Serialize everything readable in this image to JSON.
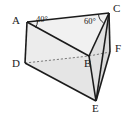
{
  "figure": {
    "kind": "triangular-prism-diagram",
    "background_color": "#ffffff",
    "stroke_color": "#1b1b1b",
    "dashed_stroke_color": "#6f6f6f",
    "face_fill_top": "#f2f2f2",
    "face_fill_front": "#e6e6e6",
    "face_fill_right": "#dedede",
    "face_fill_inner": "#ebebeb",
    "vertices": [
      {
        "name": "A",
        "label": "A",
        "x": 27,
        "y": 22,
        "label_x": 12,
        "label_y": 15
      },
      {
        "name": "B",
        "label": "B",
        "x": 89,
        "y": 56,
        "label_x": 84,
        "label_y": 58
      },
      {
        "name": "C",
        "label": "C",
        "x": 109,
        "y": 13,
        "label_x": 113,
        "label_y": 4
      },
      {
        "name": "D",
        "label": "D",
        "x": 25,
        "y": 63,
        "label_x": 12,
        "label_y": 58
      },
      {
        "name": "E",
        "label": "E",
        "x": 96,
        "y": 101,
        "label_x": 92,
        "label_y": 103
      },
      {
        "name": "F",
        "label": "F",
        "x": 110,
        "y": 52,
        "label_x": 115,
        "label_y": 44
      }
    ],
    "angles": [
      {
        "name": "angle-at-a",
        "value": "40°",
        "at_vertex": "A",
        "label_x": 36,
        "label_y": 16
      },
      {
        "name": "angle-at-c",
        "value": "60°",
        "at_vertex": "C",
        "label_x": 85,
        "label_y": 18
      }
    ],
    "solid_edges": [
      {
        "name": "edge-a-c",
        "from": "A",
        "to": "C"
      },
      {
        "name": "edge-a-d",
        "from": "A",
        "to": "D"
      },
      {
        "name": "edge-a-b",
        "from": "A",
        "to": "B"
      },
      {
        "name": "edge-c-b",
        "from": "C",
        "to": "B"
      },
      {
        "name": "edge-c-f",
        "from": "C",
        "to": "F"
      },
      {
        "name": "edge-c-e",
        "from": "C",
        "to": "E"
      },
      {
        "name": "edge-d-e",
        "from": "D",
        "to": "E"
      },
      {
        "name": "edge-b-e",
        "from": "B",
        "to": "E"
      },
      {
        "name": "edge-f-e",
        "from": "F",
        "to": "E"
      }
    ],
    "dashed_edges": [
      {
        "name": "edge-d-b",
        "from": "D",
        "to": "B"
      },
      {
        "name": "edge-b-f",
        "from": "B",
        "to": "F"
      }
    ]
  }
}
